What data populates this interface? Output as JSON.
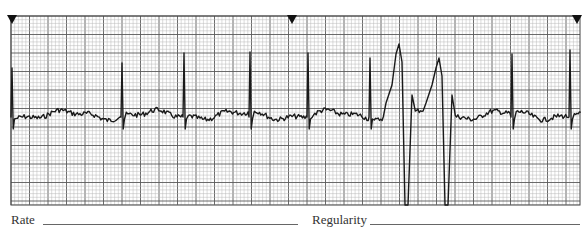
{
  "strip": {
    "type": "ecg_rhythm_strip",
    "grid": {
      "left": 11,
      "top": 16,
      "right": 580,
      "bottom": 205,
      "small_box_px": 3.7,
      "major_every": 5,
      "minor_color": "#b8b8b8",
      "major_color": "#5a5a5a",
      "border_color": "#444444"
    },
    "time_markers": [
      {
        "x": 12,
        "label": "3-second marker"
      },
      {
        "x": 292,
        "label": "3-second marker"
      },
      {
        "x": 577,
        "label": "3-second marker"
      }
    ],
    "trace_color": "#1a1a1a",
    "baseline_y": 115,
    "beats": [
      {
        "x": 12,
        "type": "normal",
        "r_top": 68
      },
      {
        "x": 122,
        "type": "normal",
        "r_top": 63
      },
      {
        "x": 184,
        "type": "normal",
        "r_top": 53
      },
      {
        "x": 250,
        "type": "normal",
        "r_top": 52
      },
      {
        "x": 308,
        "type": "normal",
        "r_top": 53
      },
      {
        "x": 370,
        "type": "normal",
        "r_top": 58
      },
      {
        "x": 400,
        "type": "pvc",
        "peak_y": 44,
        "trough_y": 205
      },
      {
        "x": 440,
        "type": "pvc",
        "peak_y": 58,
        "trough_y": 205
      },
      {
        "x": 512,
        "type": "normal",
        "r_top": 54
      },
      {
        "x": 570,
        "type": "normal",
        "r_top": 50
      }
    ]
  },
  "fields": {
    "rate_label": "Rate",
    "rate_value": "",
    "regularity_label": "Regularity",
    "regularity_value": ""
  }
}
